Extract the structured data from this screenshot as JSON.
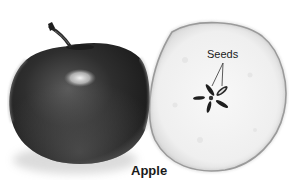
{
  "figure": {
    "labels": {
      "seeds": "Seeds",
      "caption": "Apple"
    },
    "objects": [
      {
        "name": "whole-apple",
        "description": "Whole dark apple with stem and highlight"
      },
      {
        "name": "cut-apple-half",
        "description": "Cross-section of apple showing star-shaped seed core"
      }
    ],
    "colors": {
      "apple_dark": "#2a2a2a",
      "apple_highlight": "#e8e8e8",
      "flesh": "#f4f4f4",
      "skin_edge": "#8a8a8a",
      "seed": "#1e1e1e",
      "text": "#1a1a1a"
    }
  }
}
